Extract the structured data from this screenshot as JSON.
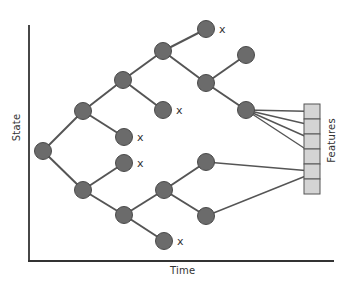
{
  "diagram": {
    "type": "tree-trajectory",
    "axes": {
      "x_label": "Time",
      "y_label": "State"
    },
    "features_label": "Features",
    "colors": {
      "node": "#6b6b6b",
      "node_stroke": "#4a4a4a",
      "edge": "#555555",
      "axis": "#333333",
      "feature_cell": "#d4d4d4",
      "feature_border": "#555555"
    },
    "nodes": [
      {
        "id": "n0",
        "x": 43,
        "y": 151,
        "pruned": false
      },
      {
        "id": "n1",
        "x": 83,
        "y": 111,
        "pruned": false
      },
      {
        "id": "n2",
        "x": 83,
        "y": 190,
        "pruned": false
      },
      {
        "id": "n3",
        "x": 123,
        "y": 80,
        "pruned": false
      },
      {
        "id": "n4",
        "x": 124,
        "y": 137,
        "pruned": true
      },
      {
        "id": "n5",
        "x": 124,
        "y": 163,
        "pruned": true
      },
      {
        "id": "n6",
        "x": 124,
        "y": 215,
        "pruned": false
      },
      {
        "id": "n7",
        "x": 163,
        "y": 51,
        "pruned": false
      },
      {
        "id": "n8",
        "x": 163,
        "y": 110,
        "pruned": true
      },
      {
        "id": "n9",
        "x": 164,
        "y": 190,
        "pruned": false
      },
      {
        "id": "n10",
        "x": 164,
        "y": 241,
        "pruned": true
      },
      {
        "id": "n11",
        "x": 206,
        "y": 29,
        "pruned": true
      },
      {
        "id": "n12",
        "x": 206,
        "y": 83,
        "pruned": false
      },
      {
        "id": "n13",
        "x": 206,
        "y": 162,
        "pruned": false
      },
      {
        "id": "n14",
        "x": 206,
        "y": 216,
        "pruned": false
      },
      {
        "id": "n15",
        "x": 246,
        "y": 55,
        "pruned": false
      },
      {
        "id": "n16",
        "x": 246,
        "y": 110,
        "pruned": false
      }
    ],
    "edges": [
      [
        "n0",
        "n1"
      ],
      [
        "n0",
        "n2"
      ],
      [
        "n1",
        "n3"
      ],
      [
        "n1",
        "n4"
      ],
      [
        "n2",
        "n5"
      ],
      [
        "n2",
        "n6"
      ],
      [
        "n3",
        "n7"
      ],
      [
        "n3",
        "n8"
      ],
      [
        "n6",
        "n9"
      ],
      [
        "n6",
        "n10"
      ],
      [
        "n7",
        "n11"
      ],
      [
        "n7",
        "n12"
      ],
      [
        "n9",
        "n13"
      ],
      [
        "n9",
        "n14"
      ],
      [
        "n12",
        "n15"
      ],
      [
        "n12",
        "n16"
      ]
    ],
    "pruned_marker": "x",
    "feature_box": {
      "x": 304,
      "y": 104,
      "cell_w": 16,
      "cell_h": 15,
      "cells": 6
    },
    "feature_links": [
      {
        "from": "n16",
        "cell": 0
      },
      {
        "from": "n16",
        "cell": 1
      },
      {
        "from": "n16",
        "cell": 2
      },
      {
        "from": "n16",
        "cell": 3
      },
      {
        "from": "n13",
        "cell": 4
      },
      {
        "from": "n14",
        "cell": 4
      }
    ]
  }
}
